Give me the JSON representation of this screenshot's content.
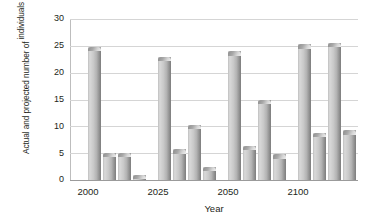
{
  "chart_data": {
    "type": "bar",
    "title": "",
    "subtitle": "",
    "xlabel": "Year",
    "ylabel_line1": "Actual and projected number of",
    "ylabel_line2": "individuals from 10–19 years of age",
    "ylabel_line3": "in millions",
    "ylabel_full": "Actual and projected number of individuals from 10–19 years of age in millions",
    "categories": [
      "2000",
      "2025",
      "2050",
      "2100"
    ],
    "ylim": [
      0,
      30
    ],
    "yticks": [
      "0",
      "5",
      "10",
      "15",
      "20",
      "25",
      "30"
    ],
    "ytick_values": [
      0,
      5,
      10,
      15,
      20,
      25,
      30
    ],
    "grid": true,
    "legend": "none",
    "bar_style": "cylinder",
    "bar_color": "#bfbfbf",
    "grid_color": "#d5d5d5",
    "axis_color": "#9b9b9b",
    "text_color": "#231f20",
    "series": [
      {
        "name": "Series 1",
        "values": [
          24.8,
          23.0,
          24.0,
          25.3
        ]
      },
      {
        "name": "Series 2",
        "values": [
          5.1,
          5.7,
          6.4,
          8.8
        ]
      },
      {
        "name": "Series 3",
        "values": [
          5.1,
          10.3,
          15.0,
          25.6
        ]
      },
      {
        "name": "Series 4",
        "values": [
          1.0,
          2.5,
          4.8,
          9.3
        ]
      }
    ]
  }
}
